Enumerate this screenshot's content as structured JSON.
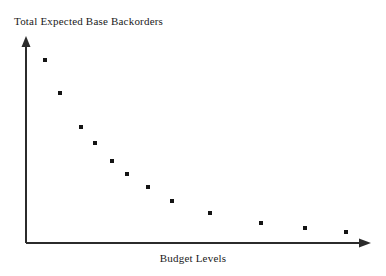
{
  "chart_data": {
    "type": "scatter",
    "title": "Total Expected Base Backorders",
    "xlabel": "Budget Levels",
    "ylabel": "Total Expected Base Backorders",
    "grid": false,
    "legend": null,
    "axis_style": "arrow-terminated",
    "tick_labels": {
      "x": [],
      "y": []
    },
    "marker": {
      "shape": "square",
      "color": "#141414",
      "size_px": 4
    },
    "xlim": [
      0,
      1
    ],
    "ylim": [
      0,
      1
    ],
    "n_points": 12,
    "x": [
      0.055,
      0.099,
      0.16,
      0.2,
      0.25,
      0.294,
      0.354,
      0.424,
      0.535,
      0.683,
      0.81,
      0.93
    ],
    "y": [
      0.893,
      0.732,
      0.566,
      0.488,
      0.4,
      0.327,
      0.259,
      0.205,
      0.146,
      0.098,
      0.073,
      0.054
    ],
    "points_px": [
      {
        "x": 45,
        "y": 60
      },
      {
        "x": 60,
        "y": 93
      },
      {
        "x": 81,
        "y": 127
      },
      {
        "x": 95,
        "y": 143
      },
      {
        "x": 112,
        "y": 161
      },
      {
        "x": 127,
        "y": 174
      },
      {
        "x": 148,
        "y": 187
      },
      {
        "x": 172,
        "y": 201
      },
      {
        "x": 210,
        "y": 213
      },
      {
        "x": 261,
        "y": 223
      },
      {
        "x": 305,
        "y": 228
      },
      {
        "x": 346,
        "y": 232
      }
    ]
  },
  "colors": {
    "background": "#ffffff",
    "axis": "#2b2b2b",
    "marker": "#141414",
    "text": "#1a1a1a"
  },
  "axes": {
    "origin_px": {
      "x": 26,
      "y": 243
    },
    "y_top_px": 38,
    "x_right_px": 370
  }
}
